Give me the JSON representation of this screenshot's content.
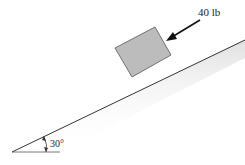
{
  "diagram": {
    "type": "inclined-plane-free-body",
    "force_label": "40 lb",
    "angle_label": "30°",
    "colors": {
      "block_fill": "#bcbcbc",
      "block_stroke": "#555555",
      "line": "#333333",
      "shadow": "#e6e6e6"
    }
  }
}
